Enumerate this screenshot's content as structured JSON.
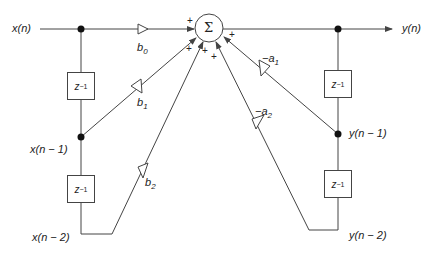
{
  "diagram": {
    "title": "",
    "type": "direct-form-I biquad IIR filter block diagram",
    "summer": {
      "symbol": "Σ",
      "signs": [
        "+",
        "+",
        "+",
        "+",
        "+"
      ]
    },
    "signals": {
      "input": "x(n)",
      "output": "y(n)",
      "x1": "x(n − 1)",
      "x2": "x(n − 2)",
      "y1": "y(n − 1)",
      "y2": "y(n − 2)"
    },
    "gains": {
      "b0": {
        "base": "b",
        "sub": "0"
      },
      "b1": {
        "base": "b",
        "sub": "1"
      },
      "b2": {
        "base": "b",
        "sub": "2"
      },
      "a1": {
        "base": "−a",
        "sub": "1"
      },
      "a2": {
        "base": "−a",
        "sub": "2"
      }
    },
    "delays": {
      "label_base": "z",
      "label_exp": "−1",
      "count": 4
    },
    "colors": {
      "line": "#444444",
      "text": "#222222",
      "node": "#111111"
    }
  }
}
